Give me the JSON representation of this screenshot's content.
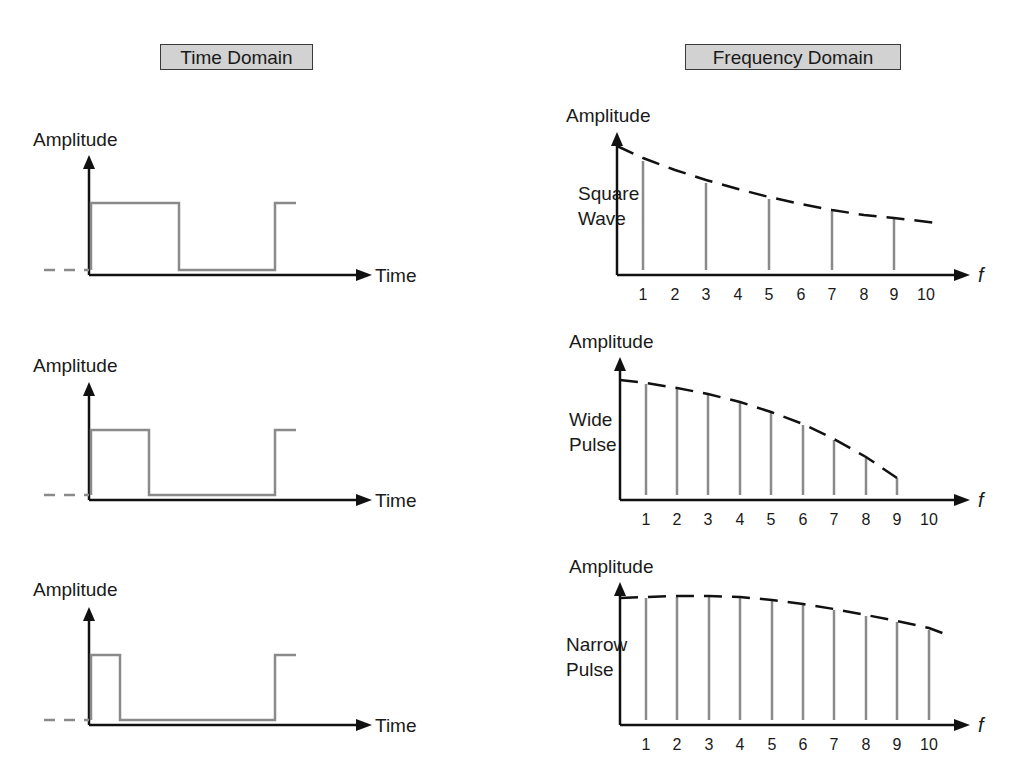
{
  "titles": {
    "time": "Time Domain",
    "frequency": "Frequency Domain"
  },
  "colors": {
    "axis": "#111111",
    "signal": "#8a8a8a",
    "envelope": "#111111",
    "title_bg": "#d2d2d2"
  },
  "time_domain": [
    {
      "name": "square-wave-time",
      "y_label": "Amplitude",
      "x_label": "Time",
      "axis": {
        "x0": 89,
        "y_base": 275,
        "y_top": 155,
        "x_end": 372
      },
      "high": 203,
      "low": 270,
      "fall_x": 179,
      "rise_x": 275,
      "end_x": 296,
      "label_pos": {
        "x": 33,
        "y": 146
      }
    },
    {
      "name": "wide-pulse-time",
      "y_label": "Amplitude",
      "x_label": "Time",
      "axis": {
        "x0": 89,
        "y_base": 500,
        "y_top": 382,
        "x_end": 372
      },
      "high": 430,
      "low": 495,
      "fall_x": 149,
      "rise_x": 275,
      "end_x": 296,
      "label_pos": {
        "x": 33,
        "y": 372
      }
    },
    {
      "name": "narrow-pulse-time",
      "y_label": "Amplitude",
      "x_label": "Time",
      "axis": {
        "x0": 89,
        "y_base": 725,
        "y_top": 607,
        "x_end": 372
      },
      "high": 655,
      "low": 720,
      "fall_x": 120,
      "rise_x": 275,
      "end_x": 296,
      "label_pos": {
        "x": 33,
        "y": 596
      }
    }
  ],
  "chart_data": [
    {
      "type": "bar",
      "title": "Square Wave",
      "xlabel": "f",
      "ylabel": "Amplitude",
      "categories": [
        1,
        2,
        3,
        4,
        5,
        6,
        7,
        8,
        9,
        10
      ],
      "values": [
        0.87,
        0,
        0.69,
        0,
        0.56,
        0,
        0.46,
        0,
        0.4,
        0
      ],
      "envelope": "dashed, decaying (≈1/f)",
      "note": "Only odd harmonics present"
    },
    {
      "type": "bar",
      "title": "Wide Pulse",
      "xlabel": "f",
      "ylabel": "Amplitude",
      "categories": [
        1,
        2,
        3,
        4,
        5,
        6,
        7,
        8,
        9,
        10
      ],
      "values": [
        0.96,
        0.92,
        0.88,
        0.81,
        0.73,
        0.63,
        0.52,
        0.37,
        0.21,
        0
      ],
      "envelope": "dashed, falls to zero near f=9"
    },
    {
      "type": "bar",
      "title": "Narrow Pulse",
      "xlabel": "f",
      "ylabel": "Amplitude",
      "categories": [
        1,
        2,
        3,
        4,
        5,
        6,
        7,
        8,
        9,
        10
      ],
      "values": [
        0.99,
        1.0,
        1.0,
        0.99,
        0.97,
        0.94,
        0.9,
        0.85,
        0.8,
        0.74
      ],
      "envelope": "dashed, slowly decaying"
    }
  ],
  "frequency_domain": [
    {
      "name": "square-wave-spectrum",
      "y_label": "Amplitude",
      "side_label": [
        "Square",
        "Wave"
      ],
      "x_label": "f",
      "tick_labels": [
        "1",
        "2",
        "3",
        "4",
        "5",
        "6",
        "7",
        "8",
        "9",
        "10"
      ],
      "axis": {
        "x0": 617,
        "y_base": 275,
        "y_top": 132,
        "x_end": 970
      },
      "tick_x": [
        643,
        675,
        706,
        738,
        769,
        801,
        832,
        864,
        894,
        926
      ],
      "bars": [
        {
          "x": 643,
          "top": 161
        },
        {
          "x": 706,
          "top": 183
        },
        {
          "x": 769,
          "top": 199
        },
        {
          "x": 832,
          "top": 211
        },
        {
          "x": 894,
          "top": 219
        }
      ],
      "envelope": [
        [
          617,
          146
        ],
        [
          643,
          158
        ],
        [
          675,
          170
        ],
        [
          706,
          180
        ],
        [
          738,
          189
        ],
        [
          769,
          197
        ],
        [
          801,
          204
        ],
        [
          832,
          210
        ],
        [
          864,
          215
        ],
        [
          894,
          218
        ],
        [
          937,
          223
        ]
      ],
      "label_pos": {
        "x": 566,
        "y": 122
      },
      "side_pos": {
        "x": 578,
        "y": 200
      }
    },
    {
      "name": "wide-pulse-spectrum",
      "y_label": "Amplitude",
      "side_label": [
        "Wide",
        "Pulse"
      ],
      "x_label": "f",
      "tick_labels": [
        "1",
        "2",
        "3",
        "4",
        "5",
        "6",
        "7",
        "8",
        "9",
        "10"
      ],
      "axis": {
        "x0": 620,
        "y_base": 500,
        "y_top": 357,
        "x_end": 970
      },
      "tick_x": [
        646,
        677,
        708,
        740,
        771,
        803,
        834,
        866,
        897,
        929
      ],
      "bars": [
        {
          "x": 646,
          "top": 384
        },
        {
          "x": 677,
          "top": 389
        },
        {
          "x": 708,
          "top": 394
        },
        {
          "x": 740,
          "top": 403
        },
        {
          "x": 771,
          "top": 413
        },
        {
          "x": 803,
          "top": 425
        },
        {
          "x": 834,
          "top": 440
        },
        {
          "x": 866,
          "top": 458
        },
        {
          "x": 897,
          "top": 478
        }
      ],
      "envelope": [
        [
          620,
          380
        ],
        [
          646,
          383
        ],
        [
          677,
          388
        ],
        [
          708,
          394
        ],
        [
          740,
          402
        ],
        [
          771,
          412
        ],
        [
          803,
          424
        ],
        [
          834,
          439
        ],
        [
          866,
          457
        ],
        [
          897,
          478
        ]
      ],
      "label_pos": {
        "x": 569,
        "y": 348
      },
      "side_pos": {
        "x": 569,
        "y": 426
      }
    },
    {
      "name": "narrow-pulse-spectrum",
      "y_label": "Amplitude",
      "side_label": [
        "Narrow",
        "Pulse"
      ],
      "x_label": "f",
      "tick_labels": [
        "1",
        "2",
        "3",
        "4",
        "5",
        "6",
        "7",
        "8",
        "9",
        "10"
      ],
      "axis": {
        "x0": 620,
        "y_base": 725,
        "y_top": 582,
        "x_end": 970
      },
      "tick_x": [
        646,
        677,
        709,
        740,
        772,
        803,
        834,
        866,
        897,
        929
      ],
      "bars": [
        {
          "x": 646,
          "top": 598
        },
        {
          "x": 677,
          "top": 597
        },
        {
          "x": 709,
          "top": 597
        },
        {
          "x": 740,
          "top": 598
        },
        {
          "x": 772,
          "top": 601
        },
        {
          "x": 803,
          "top": 605
        },
        {
          "x": 834,
          "top": 610
        },
        {
          "x": 866,
          "top": 616
        },
        {
          "x": 897,
          "top": 622
        },
        {
          "x": 929,
          "top": 630
        }
      ],
      "envelope": [
        [
          620,
          598
        ],
        [
          646,
          597
        ],
        [
          677,
          596
        ],
        [
          709,
          596
        ],
        [
          740,
          597
        ],
        [
          772,
          600
        ],
        [
          803,
          604
        ],
        [
          834,
          609
        ],
        [
          866,
          615
        ],
        [
          897,
          621
        ],
        [
          929,
          628
        ],
        [
          945,
          634
        ]
      ],
      "label_pos": {
        "x": 569,
        "y": 573
      },
      "side_pos": {
        "x": 566,
        "y": 651
      }
    }
  ]
}
